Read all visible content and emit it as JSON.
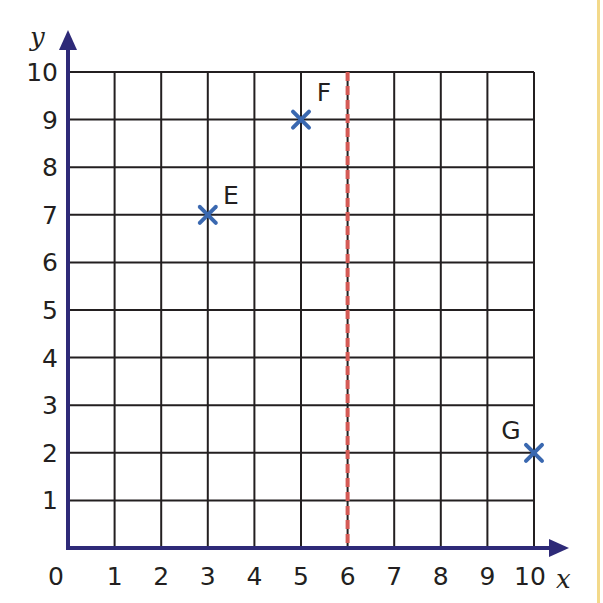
{
  "chart_data": {
    "type": "scatter",
    "title": "",
    "xlabel": "x",
    "ylabel": "y",
    "xlim": [
      0,
      10
    ],
    "ylim": [
      0,
      10
    ],
    "grid": true,
    "x_ticks": [
      "0",
      "1",
      "2",
      "3",
      "4",
      "5",
      "6",
      "7",
      "8",
      "9",
      "10"
    ],
    "y_ticks": [
      "1",
      "2",
      "3",
      "4",
      "5",
      "6",
      "7",
      "8",
      "9",
      "10"
    ],
    "points": [
      {
        "label": "E",
        "x": 3,
        "y": 7
      },
      {
        "label": "F",
        "x": 5,
        "y": 9
      },
      {
        "label": "G",
        "x": 10,
        "y": 2
      }
    ],
    "reference_lines": [
      {
        "type": "vertical",
        "x": 6,
        "style": "dashed",
        "color": "#d9534f",
        "description": "mirror line x = 6"
      }
    ],
    "legend": null
  },
  "colors": {
    "axis": "#2e2a78",
    "grid": "#231f20",
    "marker": "#3a68b0",
    "mirror_line": "#d45a55",
    "edge": "#f3d98a"
  }
}
